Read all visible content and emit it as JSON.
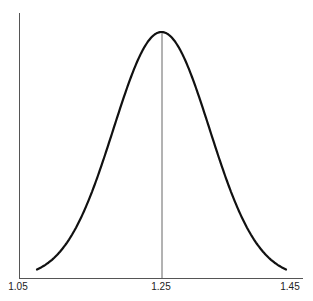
{
  "chart_data": {
    "type": "line",
    "title": "",
    "xlabel": "",
    "ylabel": "",
    "xlim": [
      1.05,
      1.45
    ],
    "x_ticks": [
      "1.05",
      "1.25",
      "1.45"
    ],
    "grid": false,
    "legend": null,
    "series": [
      {
        "name": "bell-curve",
        "shape": "symmetric bell (normal-like) distribution",
        "peak_x": 1.25,
        "x_start": 1.075,
        "x_end": 1.425
      }
    ],
    "annotations": [
      {
        "type": "vertical-line",
        "x": 1.25,
        "description": "line from x-axis to curve peak"
      }
    ]
  },
  "axis": {
    "tick_1": "1.05",
    "tick_2": "1.25",
    "tick_3": "1.45"
  }
}
